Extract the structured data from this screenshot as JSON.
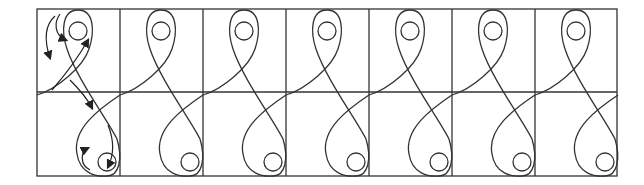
{
  "diagram": {
    "type": "tiled-figure-eight-pattern",
    "columns": 7,
    "rows": 2,
    "first_cell_annotated_with_arrows": true,
    "stroke_color": "#333333",
    "background": "#ffffff"
  }
}
